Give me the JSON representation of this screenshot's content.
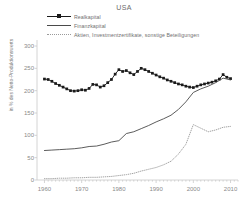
{
  "chart_data": {
    "type": "line",
    "title": "USA",
    "xlabel": "",
    "ylabel": "in % des Netto-Produktionswerts",
    "xlim": [
      1958,
      2012
    ],
    "ylim": [
      0,
      300
    ],
    "yticks": [
      0,
      50,
      100,
      150,
      200,
      250,
      300
    ],
    "xticks": [
      1960,
      1970,
      1980,
      1990,
      2000,
      2010
    ],
    "grid": false,
    "legend_position": "top-left",
    "series": [
      {
        "name": "Realkapital",
        "style": "solid-with-square-markers",
        "color": "#1a1a1a",
        "x": [
          1960,
          1961,
          1962,
          1963,
          1964,
          1965,
          1966,
          1967,
          1968,
          1969,
          1970,
          1971,
          1972,
          1973,
          1974,
          1975,
          1976,
          1977,
          1978,
          1979,
          1980,
          1981,
          1982,
          1983,
          1984,
          1985,
          1986,
          1987,
          1988,
          1989,
          1990,
          1991,
          1992,
          1993,
          1994,
          1995,
          1996,
          1997,
          1998,
          1999,
          2000,
          2001,
          2002,
          2003,
          2004,
          2005,
          2006,
          2007,
          2008,
          2009,
          2010
        ],
        "values": [
          226,
          225,
          221,
          216,
          212,
          208,
          204,
          200,
          199,
          200,
          202,
          201,
          205,
          214,
          213,
          208,
          211,
          218,
          225,
          237,
          247,
          243,
          245,
          240,
          236,
          243,
          250,
          247,
          243,
          239,
          235,
          231,
          228,
          224,
          221,
          218,
          215,
          213,
          210,
          208,
          207,
          210,
          213,
          215,
          217,
          219,
          222,
          226,
          236,
          230,
          227
        ]
      },
      {
        "name": "Finanzkapital",
        "style": "solid",
        "color": "#4a4a4a",
        "x": [
          1960,
          1962,
          1964,
          1966,
          1968,
          1970,
          1972,
          1974,
          1976,
          1978,
          1980,
          1982,
          1984,
          1986,
          1988,
          1990,
          1992,
          1994,
          1996,
          1998,
          2000,
          2002,
          2004,
          2006,
          2008,
          2010
        ],
        "values": [
          66,
          67,
          68,
          69,
          70,
          72,
          75,
          76,
          80,
          85,
          88,
          104,
          108,
          115,
          122,
          130,
          137,
          145,
          158,
          175,
          196,
          204,
          210,
          218,
          228,
          224
        ]
      },
      {
        "name": "Aktien, Investmentzertifikate, sonstige Beteiligungen",
        "style": "dotted",
        "color": "#9a9a9a",
        "x": [
          1960,
          1962,
          1964,
          1966,
          1968,
          1970,
          1972,
          1974,
          1976,
          1978,
          1980,
          1982,
          1984,
          1986,
          1988,
          1990,
          1992,
          1994,
          1996,
          1998,
          2000,
          2002,
          2004,
          2006,
          2008,
          2010
        ],
        "values": [
          3,
          3,
          4,
          4,
          5,
          5,
          6,
          6,
          7,
          8,
          10,
          12,
          15,
          20,
          24,
          28,
          34,
          42,
          58,
          80,
          124,
          116,
          108,
          112,
          118,
          120
        ]
      }
    ]
  }
}
